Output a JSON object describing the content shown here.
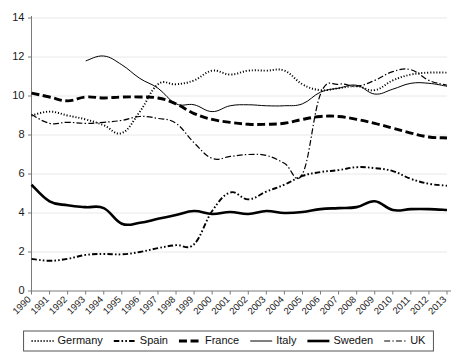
{
  "chart_data": {
    "type": "line",
    "title": "",
    "subtitle": "",
    "xlabel": "",
    "ylabel": "",
    "xlim": [
      1990,
      2013
    ],
    "ylim": [
      0,
      14
    ],
    "yticks": [
      0,
      2,
      4,
      6,
      8,
      10,
      12,
      14
    ],
    "grid": true,
    "legend_position": "bottom",
    "categories": [
      "1990",
      "1991",
      "1992",
      "1993",
      "1994",
      "1995",
      "1996",
      "1997",
      "1998",
      "1999",
      "2000",
      "2001",
      "2002",
      "2003",
      "2004",
      "2005",
      "2006",
      "2007",
      "2008",
      "2009",
      "2010",
      "2011",
      "2012",
      "2013"
    ],
    "series": [
      {
        "name": "Germany",
        "style": "dotted",
        "values": [
          9.0,
          9.2,
          9.0,
          8.8,
          8.5,
          8.1,
          9.2,
          10.6,
          10.6,
          10.8,
          11.3,
          11.1,
          11.3,
          11.3,
          11.3,
          10.6,
          10.3,
          10.4,
          10.5,
          10.3,
          10.8,
          11.1,
          11.2,
          11.2
        ]
      },
      {
        "name": "Spain",
        "style": "dash-dot-dot",
        "values": [
          1.65,
          1.55,
          1.65,
          1.85,
          1.9,
          1.88,
          2.0,
          2.2,
          2.35,
          2.4,
          4.1,
          5.05,
          4.7,
          5.1,
          5.45,
          5.9,
          6.1,
          6.2,
          6.35,
          6.3,
          6.15,
          5.75,
          5.5,
          5.4
        ]
      },
      {
        "name": "France",
        "style": "bold-dash",
        "values": [
          10.15,
          9.95,
          9.75,
          9.95,
          9.9,
          9.95,
          9.95,
          9.9,
          9.6,
          9.1,
          8.8,
          8.65,
          8.55,
          8.55,
          8.6,
          8.8,
          8.95,
          8.95,
          8.8,
          8.6,
          8.35,
          8.1,
          7.9,
          7.85
        ]
      },
      {
        "name": "Italy",
        "style": "thin-solid",
        "values": [
          null,
          null,
          null,
          11.8,
          12.05,
          11.6,
          10.9,
          10.4,
          9.6,
          9.55,
          9.2,
          9.5,
          9.55,
          9.5,
          9.5,
          9.6,
          10.2,
          10.4,
          10.55,
          10.1,
          10.35,
          10.65,
          10.65,
          10.5
        ]
      },
      {
        "name": "Sweden",
        "style": "bold-solid",
        "values": [
          5.45,
          4.6,
          4.4,
          4.3,
          4.25,
          3.45,
          3.5,
          3.7,
          3.9,
          4.1,
          3.95,
          4.05,
          3.95,
          4.1,
          4.0,
          4.05,
          4.2,
          4.25,
          4.3,
          4.6,
          4.15,
          4.2,
          4.2,
          4.15
        ]
      },
      {
        "name": "UK",
        "style": "dash-dot",
        "values": [
          9.05,
          8.6,
          8.65,
          8.6,
          8.65,
          8.75,
          8.95,
          8.85,
          8.6,
          7.6,
          6.8,
          6.9,
          7.0,
          6.95,
          6.55,
          6.0,
          10.1,
          10.6,
          10.5,
          10.8,
          11.25,
          11.35,
          10.8,
          10.55
        ]
      }
    ]
  },
  "legend": {
    "items": [
      {
        "label": "Germany",
        "style": "dotted"
      },
      {
        "label": "Spain",
        "style": "dash-dot-dot"
      },
      {
        "label": "France",
        "style": "bold-dash"
      },
      {
        "label": "Italy",
        "style": "thin-solid"
      },
      {
        "label": "Sweden",
        "style": "bold-solid"
      },
      {
        "label": "UK",
        "style": "dash-dot"
      }
    ]
  },
  "colors": {
    "line": "#000000",
    "grid": "#e8e8e8",
    "axis": "#7a7a7a",
    "text": "#111111",
    "background": "#ffffff"
  }
}
